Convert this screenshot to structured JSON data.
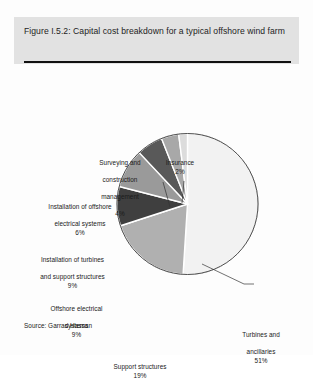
{
  "figure": {
    "title": "Figure I.5.2: Capital cost breakdown for a typical offshore wind farm",
    "source": "Source: Garrad Hassan"
  },
  "chart_data": {
    "type": "pie",
    "title": "Figure I.5.2: Capital cost breakdown for a typical offshore wind farm",
    "source": "Garrad Hassan",
    "unit": "%",
    "legend": "none",
    "labels_position": "outside-with-leader-lines",
    "start_angle_deg": 0,
    "direction": "clockwise",
    "categories": [
      "Turbines and ancillaries",
      "Support structures",
      "Offshore electrical systems",
      "Installation of turbines and support structures",
      "Installation of offshore electrical systems",
      "Surveying and construction management",
      "Insurance"
    ],
    "values": [
      51,
      19,
      9,
      9,
      6,
      4,
      2
    ],
    "colors": [
      "#f2f2f2",
      "#b0b0b0",
      "#3f3f3f",
      "#9a9a9a",
      "#595959",
      "#a8a8a8",
      "#dcdcdc"
    ],
    "slices": [
      {
        "name": "Turbines and ancillaries",
        "value": 51,
        "label_line1": "Turbines and",
        "label_line2": "ancillaries",
        "label_pct": "51%",
        "color": "#f2f2f2"
      },
      {
        "name": "Support structures",
        "value": 19,
        "label_line1": "Support structures",
        "label_line2": "",
        "label_pct": "19%",
        "color": "#b0b0b0"
      },
      {
        "name": "Offshore electrical systems",
        "value": 9,
        "label_line1": "Offshore electrical",
        "label_line2": "systems",
        "label_pct": "9%",
        "color": "#3f3f3f"
      },
      {
        "name": "Installation of turbines and support structures",
        "value": 9,
        "label_line1": "Installation of turbines",
        "label_line2": "and support structures",
        "label_pct": "9%",
        "color": "#9a9a9a"
      },
      {
        "name": "Installation of offshore electrical systems",
        "value": 6,
        "label_line1": "Installation of offshore",
        "label_line2": "electrical systems",
        "label_pct": "6%",
        "color": "#595959"
      },
      {
        "name": "Surveying and construction management",
        "value": 4,
        "label_line1": "Surveying and",
        "label_line2": "construction",
        "label_line3": "management",
        "label_pct": "4%",
        "color": "#a8a8a8"
      },
      {
        "name": "Insurance",
        "value": 2,
        "label_line1": "Insurance",
        "label_line2": "",
        "label_pct": "2%",
        "color": "#dcdcdc"
      }
    ]
  }
}
